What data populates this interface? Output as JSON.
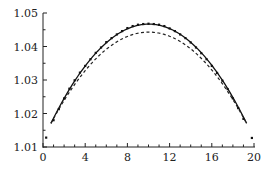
{
  "chart_data": {
    "type": "line",
    "title": "",
    "xlabel": "",
    "ylabel": "",
    "xlim": [
      0,
      20
    ],
    "ylim": [
      1.01,
      1.05
    ],
    "grid": false,
    "legend": null,
    "x_ticks": [
      0,
      4,
      8,
      12,
      16,
      20
    ],
    "x_tick_labels": [
      "0",
      "4",
      "8",
      "12",
      "16",
      "20"
    ],
    "y_ticks": [
      1.01,
      1.02,
      1.03,
      1.04,
      1.05
    ],
    "y_tick_labels": [
      "1.01",
      "1.02",
      "1.03",
      "1.04",
      "1.05"
    ],
    "series": [
      {
        "name": "solid curve",
        "style": "solid",
        "x": [
          0.75,
          2,
          4,
          6,
          8,
          10,
          12,
          14,
          16,
          18,
          19.3
        ],
        "values": [
          1.0171,
          1.0245,
          1.0342,
          1.0412,
          1.0453,
          1.0467,
          1.0453,
          1.0412,
          1.0342,
          1.0245,
          1.017
        ]
      },
      {
        "name": "dashed curve",
        "style": "dashed",
        "x": [
          0.75,
          2,
          4,
          6,
          8,
          10,
          12,
          14,
          16,
          18,
          19.3
        ],
        "values": [
          1.0171,
          1.0239,
          1.0328,
          1.0392,
          1.043,
          1.0443,
          1.043,
          1.0392,
          1.0328,
          1.0239,
          1.017
        ]
      },
      {
        "name": "data points",
        "style": "markers",
        "x": [
          0.3,
          1,
          1.5,
          2,
          2.5,
          3,
          3.5,
          4,
          4.5,
          5,
          5.5,
          6,
          6.5,
          7,
          7.5,
          8,
          8.5,
          9,
          9.5,
          10,
          10.5,
          11,
          11.5,
          12,
          12.5,
          13,
          13.5,
          14,
          14.5,
          15,
          15.5,
          16,
          16.5,
          17,
          17.5,
          18,
          18.5,
          19,
          19.8
        ],
        "values": [
          1.0128,
          1.018,
          1.0213,
          1.0245,
          1.0274,
          1.0299,
          1.0322,
          1.0342,
          1.0362,
          1.0381,
          1.0397,
          1.0413,
          1.0425,
          1.0436,
          1.0446,
          1.0455,
          1.0461,
          1.0465,
          1.0467,
          1.0468,
          1.0467,
          1.0465,
          1.0461,
          1.0454,
          1.0446,
          1.0436,
          1.0425,
          1.0412,
          1.0397,
          1.038,
          1.0362,
          1.0342,
          1.0321,
          1.0298,
          1.0273,
          1.0245,
          1.0216,
          1.0184,
          1.0127
        ]
      }
    ]
  },
  "caption": {
    "text": ""
  }
}
